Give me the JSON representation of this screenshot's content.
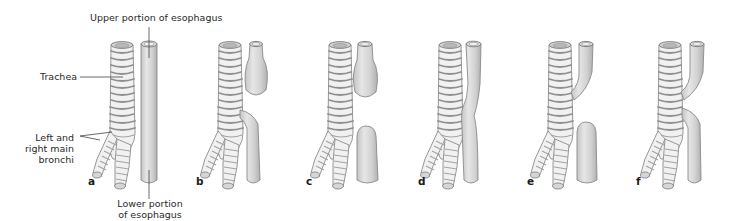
{
  "figure": {
    "colors": {
      "background": "#ffffff",
      "tube_fill": "#d4d4d4",
      "tube_stroke": "#8a8a8a",
      "ring_stroke": "#8f8f8f",
      "text": "#2a2a2a"
    }
  },
  "labels": {
    "upper_esophagus": "Upper portion of esophagus",
    "trachea": "Trachea",
    "bronchi_line1": "Left and",
    "bronchi_line2": "right main",
    "bronchi_line3": "bronchi",
    "lower_esophagus_line1": "Lower portion",
    "lower_esophagus_line2": "of esophagus"
  },
  "panels": [
    {
      "id": "a",
      "label": "a",
      "description": "Normal: continuous esophagus beside trachea"
    },
    {
      "id": "b",
      "label": "b",
      "description": "Upper esophageal pouch; lower esophagus joined to trachea (distal fistula)"
    },
    {
      "id": "c",
      "label": "c",
      "description": "Upper and lower blind esophageal pouches, no fistula"
    },
    {
      "id": "d",
      "label": "d",
      "description": "Continuous esophagus with H-type fistula to trachea"
    },
    {
      "id": "e",
      "label": "e",
      "description": "Upper esophagus joined to trachea (proximal fistula); lower blind pouch"
    },
    {
      "id": "f",
      "label": "f",
      "description": "Both upper and lower esophageal segments joined to trachea"
    }
  ]
}
